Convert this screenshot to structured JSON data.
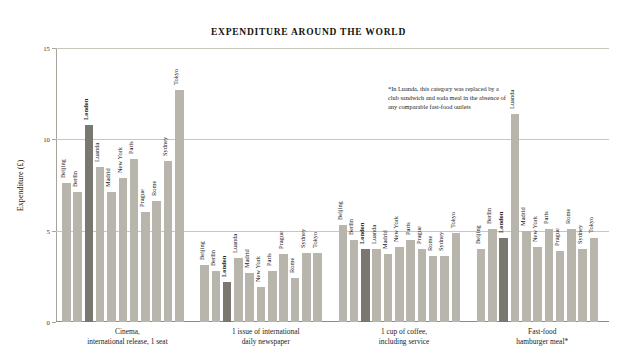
{
  "chart_data": {
    "type": "bar",
    "title": "EXPENDITURE AROUND THE WORLD",
    "xlabel": "",
    "ylabel": "Expenditure (£)",
    "ylim": [
      0,
      15
    ],
    "yticks": [
      0,
      5,
      10,
      15
    ],
    "ytick_labels": [
      "0",
      "5",
      "10",
      "15"
    ],
    "grid": true,
    "legend": "none",
    "highlight_city": "London",
    "highlight_color": "#7a7770",
    "bar_color": "#b8b5ad",
    "cities": [
      "Beijing",
      "Berlin",
      "London",
      "Luanda",
      "Madrid",
      "New York",
      "Paris",
      "Prague",
      "Rome",
      "Sydney",
      "Tokyo"
    ],
    "categories": [
      "Cinema,\ninternational release, 1 seat",
      "1 issue of international\ndaily newspaper",
      "1 cup of coffee,\nincluding service",
      "Fast-food\nhamburger meal*"
    ],
    "groups": [
      {
        "category": "Cinema,\ninternational release, 1 seat",
        "values": [
          7.6,
          7.1,
          10.8,
          8.5,
          7.1,
          7.9,
          8.9,
          6.0,
          6.6,
          8.8,
          12.7
        ]
      },
      {
        "category": "1 issue of international\ndaily newspaper",
        "values": [
          3.1,
          2.8,
          2.2,
          3.5,
          2.7,
          1.9,
          2.8,
          3.7,
          2.4,
          3.8,
          3.8
        ]
      },
      {
        "category": "1 cup of coffee,\nincluding service",
        "values": [
          5.3,
          4.5,
          4.0,
          4.0,
          3.7,
          4.1,
          4.5,
          4.0,
          3.6,
          3.6,
          4.9
        ]
      },
      {
        "category": "Fast-food\nhamburger meal*",
        "values": [
          4.0,
          5.1,
          4.6,
          11.4,
          5.0,
          4.1,
          5.1,
          3.9,
          5.1,
          4.0,
          4.6
        ]
      }
    ],
    "annotation": "*In Luanda, this category was replaced by a club sandwich and soda meal in the absence of any comparable fast-food outlets"
  }
}
